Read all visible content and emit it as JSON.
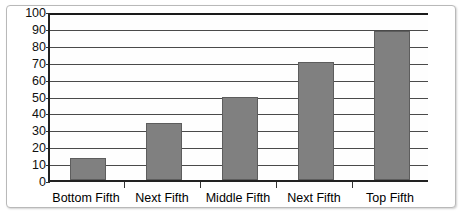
{
  "chart_data": {
    "type": "bar",
    "title": "",
    "subtitle": "",
    "xlabel": "",
    "ylabel": "",
    "categories": [
      "Bottom Fifth",
      "Next Fifth",
      "Middle Fifth",
      "Next Fifth",
      "Top Fifth"
    ],
    "values": [
      13,
      34,
      49,
      70,
      88
    ],
    "series": [
      {
        "name": "",
        "values": [
          13,
          34,
          49,
          70,
          88
        ]
      }
    ],
    "ylim": [
      0,
      100
    ],
    "ytick_step": 10,
    "yticks": [
      100,
      90,
      80,
      70,
      60,
      50,
      40,
      30,
      20,
      10,
      0
    ],
    "grid": true,
    "legend": false,
    "legend_position": "none",
    "bar_color": "#808080",
    "bar_edge_color": "#5d5d5d",
    "grid_color": "#4a4a4a",
    "axis_color": "#222222",
    "plot_background": "#fefefe",
    "frame_border_color": "#b9b9b9"
  }
}
